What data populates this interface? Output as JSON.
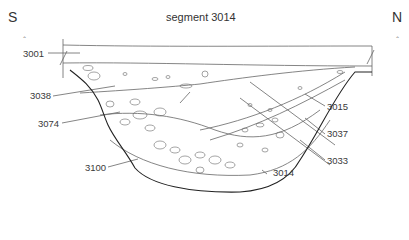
{
  "title": "segment 3014",
  "directions": {
    "left": "S",
    "right": "N"
  },
  "scale_marks": {
    "left": "⌃",
    "right": "⌃"
  },
  "labels": {
    "l3001": "3001",
    "l3038": "3038",
    "l3074": "3074",
    "l3100": "3100",
    "l3015": "3015",
    "l3037": "3037",
    "l3033": "3033",
    "l3014": "3014"
  },
  "colors": {
    "line": "#555555",
    "cut": "#222222",
    "background": "#ffffff"
  }
}
